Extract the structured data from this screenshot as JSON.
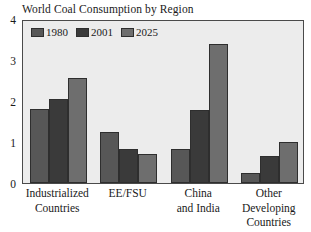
{
  "chart_data": {
    "type": "bar",
    "title": "World Coal Consumption by Region",
    "xlabel": "",
    "ylabel": "",
    "ylim": [
      0,
      4
    ],
    "yticks": [
      "0",
      "1",
      "2",
      "3",
      "4"
    ],
    "grid": false,
    "legend_position": "top-left",
    "categories": [
      "Industrialized Countries",
      "EE/FSU",
      "China and India",
      "Other Developing Countries"
    ],
    "category_lines": [
      [
        "Industrialized",
        "Countries"
      ],
      [
        "EE/FSU"
      ],
      [
        "China",
        "and India"
      ],
      [
        "Other",
        "Developing",
        "Countries"
      ]
    ],
    "series": [
      {
        "name": "1980",
        "color": "#575757",
        "values": [
          1.8,
          1.25,
          0.83,
          0.25
        ]
      },
      {
        "name": "2001",
        "color": "#3a3a3a",
        "values": [
          2.05,
          0.83,
          1.78,
          0.67
        ]
      },
      {
        "name": "2025",
        "color": "#6e6e6e",
        "values": [
          2.55,
          0.7,
          3.4,
          1.0
        ]
      }
    ]
  },
  "style": {
    "plot_background": "#ececec",
    "frame_color": "#4a4a4a",
    "text_color": "#1a1a1a"
  }
}
